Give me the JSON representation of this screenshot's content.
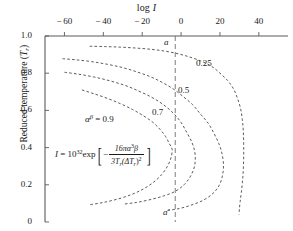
{
  "chart_data": {
    "type": "line",
    "title": "",
    "xlabel": "log I",
    "ylabel": "Reduced temperature (Tr)",
    "xlim": [
      -70,
      55
    ],
    "ylim": [
      0,
      1.0
    ],
    "xticks": [
      "-60",
      "-40",
      "-20",
      "0",
      "20",
      "40"
    ],
    "xtick_values": [
      -60,
      -40,
      -20,
      0,
      20,
      40
    ],
    "yticks": [
      "1.0",
      "0.8",
      "0.6",
      "0.4",
      "0.2",
      "0"
    ],
    "ytick_values": [
      1.0,
      0.8,
      0.6,
      0.4,
      0.2,
      0
    ],
    "grid": false,
    "legend_position": "inline-curve-labels",
    "line_style": "dashed",
    "annotations": {
      "vertical_line_value": -3,
      "vertical_line_top_label": "a",
      "vertical_line_bottom_label": "a′",
      "parameter_label": "αβ⅓ = 0.9",
      "equation_lhs": "I = 10",
      "equation_exponent": "32",
      "equation_exp_fn": "exp",
      "equation_frac_numerator": "16πα³β",
      "equation_frac_denominator": "3Tr(ΔTr)²",
      "equation_sign": "−"
    },
    "series": [
      {
        "name": "0.9",
        "label": "αβ⅓ = 0.9",
        "nose_logI": -4,
        "nose_Tr": 0.39,
        "top_Tr": 0.71,
        "points": [
          [
            -51,
            0.71
          ],
          [
            -45,
            0.69
          ],
          [
            -38,
            0.665
          ],
          [
            -31,
            0.635
          ],
          [
            -25,
            0.605
          ],
          [
            -20,
            0.575
          ],
          [
            -15,
            0.54
          ],
          [
            -11,
            0.5
          ],
          [
            -8,
            0.46
          ],
          [
            -6,
            0.42
          ],
          [
            -4.6,
            0.39
          ],
          [
            -5.2,
            0.345
          ],
          [
            -7,
            0.3
          ],
          [
            -10,
            0.255
          ],
          [
            -14,
            0.215
          ],
          [
            -19,
            0.18
          ],
          [
            -25,
            0.15
          ],
          [
            -32,
            0.125
          ],
          [
            -40,
            0.105
          ],
          [
            -47,
            0.093
          ]
        ]
      },
      {
        "name": "0.7",
        "label": "0.7",
        "nose_logI": 7,
        "nose_Tr": 0.33,
        "top_Tr": 0.805,
        "points": [
          [
            -60,
            0.805
          ],
          [
            -53,
            0.795
          ],
          [
            -45,
            0.78
          ],
          [
            -37,
            0.76
          ],
          [
            -29,
            0.735
          ],
          [
            -22,
            0.705
          ],
          [
            -15,
            0.67
          ],
          [
            -9,
            0.63
          ],
          [
            -4,
            0.585
          ],
          [
            0,
            0.535
          ],
          [
            3,
            0.48
          ],
          [
            5.5,
            0.43
          ],
          [
            7,
            0.38
          ],
          [
            7.3,
            0.33
          ],
          [
            6.5,
            0.285
          ],
          [
            4.5,
            0.24
          ],
          [
            1.5,
            0.2
          ],
          [
            -3,
            0.165
          ],
          [
            -9,
            0.14
          ],
          [
            -16,
            0.12
          ],
          [
            -23,
            0.105
          ],
          [
            -29,
            0.097
          ]
        ]
      },
      {
        "name": "0.5",
        "label": "0.5",
        "nose_logI": 22,
        "nose_Tr": 0.3,
        "top_Tr": 0.878,
        "points": [
          [
            -61,
            0.878
          ],
          [
            -54,
            0.872
          ],
          [
            -46,
            0.862
          ],
          [
            -38,
            0.848
          ],
          [
            -30,
            0.83
          ],
          [
            -23,
            0.808
          ],
          [
            -16,
            0.782
          ],
          [
            -10,
            0.752
          ],
          [
            -4,
            0.715
          ],
          [
            1,
            0.675
          ],
          [
            6,
            0.63
          ],
          [
            10,
            0.58
          ],
          [
            14,
            0.53
          ],
          [
            17,
            0.475
          ],
          [
            19.5,
            0.42
          ],
          [
            21,
            0.37
          ],
          [
            21.8,
            0.31
          ],
          [
            21.3,
            0.25
          ],
          [
            19.5,
            0.195
          ],
          [
            16,
            0.15
          ],
          [
            11,
            0.115
          ],
          [
            5,
            0.09
          ],
          [
            -1,
            0.072
          ],
          [
            -7,
            0.062
          ]
        ]
      },
      {
        "name": "0.25",
        "label": "0.25",
        "nose_logI": 32,
        "nose_Tr": 0.32,
        "top_Tr": 0.945,
        "points": [
          [
            -47,
            0.945
          ],
          [
            -39,
            0.943
          ],
          [
            -31,
            0.94
          ],
          [
            -23,
            0.935
          ],
          [
            -15,
            0.928
          ],
          [
            -8,
            0.918
          ],
          [
            -1,
            0.903
          ],
          [
            5,
            0.885
          ],
          [
            11,
            0.862
          ],
          [
            16,
            0.835
          ],
          [
            20,
            0.8
          ],
          [
            24,
            0.76
          ],
          [
            27,
            0.715
          ],
          [
            29,
            0.665
          ],
          [
            30.6,
            0.61
          ],
          [
            31.5,
            0.55
          ],
          [
            32,
            0.49
          ],
          [
            32.2,
            0.42
          ],
          [
            32.2,
            0.35
          ],
          [
            32,
            0.28
          ],
          [
            31.6,
            0.22
          ],
          [
            31,
            0.16
          ],
          [
            30.4,
            0.11
          ],
          [
            30,
            0.07
          ],
          [
            29.8,
            0.04
          ]
        ]
      }
    ]
  },
  "labels": {
    "x_axis_title_main": "log",
    "x_axis_title_var": "I",
    "y_axis_title_main": "Reduced temperature (",
    "y_axis_title_var": "T",
    "y_axis_title_sub": "r",
    "y_axis_title_close": ")",
    "curve_025": "0.25",
    "curve_05": "0.5",
    "curve_07": "0.7",
    "param_alpha": "α",
    "param_beta": "β",
    "param_equals": "= 0.9",
    "tag_a": "a",
    "tag_a_prime": "a′",
    "eq_I": "I",
    "eq_eq": "=",
    "eq_ten": "10",
    "eq_exponent": "32",
    "eq_exp": "exp",
    "eq_minus": "−",
    "eq_num_16pi": "16πα",
    "eq_num_sup": "3",
    "eq_num_beta": "β",
    "eq_den_3T": "3T",
    "eq_den_sub1": "r",
    "eq_den_dT": "(ΔT",
    "eq_den_sub2": "r",
    "eq_den_close": ")",
    "eq_den_sup": "2"
  },
  "style": {
    "axis_color": "#5a5a5a",
    "curve_color": "#4a4a4a",
    "text_color": "#1a1a1a",
    "background": "#ffffff"
  }
}
